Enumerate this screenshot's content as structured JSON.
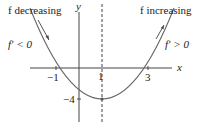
{
  "diagram": {
    "labels": {
      "decreasing": "f decreasing",
      "increasing": "f increasing",
      "fprime_neg": "f′ < 0",
      "fprime_pos": "f′ > 0",
      "x_axis": "x",
      "y_axis": "y"
    },
    "ticks": {
      "x_neg1": "−1",
      "x_1": "1",
      "x_3": "3",
      "y_neg4": "−4"
    },
    "curve": {
      "type": "parabola",
      "roots": [
        -1,
        3
      ],
      "vertex": [
        1,
        -4
      ],
      "axis_of_symmetry": "x = 1 (dashed)"
    },
    "colors": {
      "axes": "#333333",
      "curve": "#555555",
      "text": "#222222"
    }
  }
}
